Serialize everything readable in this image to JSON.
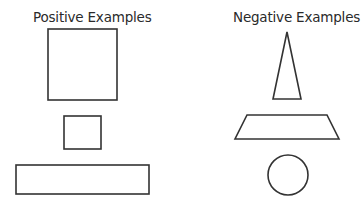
{
  "positive": {
    "title": "Positive Examples",
    "shapes": [
      "large-square",
      "small-square",
      "wide-rectangle"
    ]
  },
  "negative": {
    "title": "Negative Examples",
    "shapes": [
      "tall-triangle",
      "trapezoid",
      "circle"
    ]
  },
  "colors": {
    "stroke": "#333333",
    "background": "#ffffff",
    "text": "#2a2a2a"
  }
}
